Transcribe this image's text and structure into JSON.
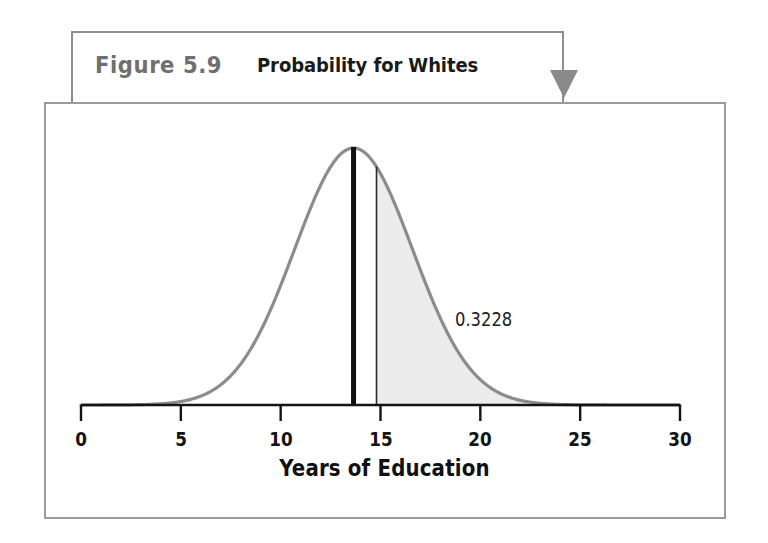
{
  "figure": {
    "number_label": "Figure 5.9",
    "caption": "Probability for Whites",
    "number_color": "#6f6f6f",
    "caption_color": "#1a1a1a",
    "callout_border_color": "#8e8e8e",
    "arrow_color": "#8a8a8a",
    "frame_border_color": "#9a9a9a",
    "arrow_icon": "triangle-down-icon"
  },
  "chart_data": {
    "type": "area",
    "title": "Probability for Whites",
    "xlabel": "Years of Education",
    "ylabel": "",
    "xlim": [
      0,
      30
    ],
    "xticks": [
      0,
      5,
      10,
      15,
      20,
      25,
      30
    ],
    "xtick_labels": [
      "0",
      "5",
      "10",
      "15",
      "20",
      "25",
      "30"
    ],
    "grid": false,
    "legend": "none",
    "curve": {
      "name": "Normal density of years of education (Whites)",
      "distribution": "normal",
      "mean": 13.65,
      "std_dev": 2.95,
      "stroke_color": "#8c8c8c",
      "stroke_width": 3.2
    },
    "markers": [
      {
        "name": "mean-line",
        "x": 13.65,
        "style": "thick-solid",
        "color": "#111111",
        "width": 5
      },
      {
        "name": "cutoff-line",
        "x": 14.8,
        "style": "thin-solid",
        "color": "#2a2a2a",
        "width": 1.6
      }
    ],
    "shaded_region": {
      "name": "upper-tail-area",
      "from_x": 14.8,
      "to_x": 30,
      "fill_color": "#ececec",
      "probability": 0.3228,
      "label": "0.3228"
    },
    "annotations": [
      {
        "text": "0.3228",
        "x": 20.5,
        "y_rel": 0.36
      }
    ]
  },
  "annotation_label": "0.3228",
  "axis_title": "Years of Education"
}
